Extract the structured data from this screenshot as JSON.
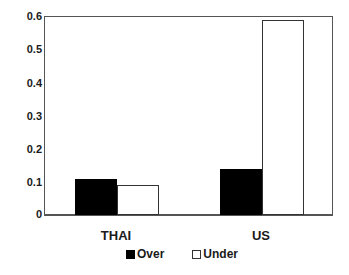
{
  "chart_data": {
    "type": "bar",
    "title": "",
    "xlabel": "",
    "ylabel": "",
    "categories": [
      "THAI",
      "US"
    ],
    "series": [
      {
        "name": "Over",
        "values": [
          0.11,
          0.14
        ],
        "color": "#000000"
      },
      {
        "name": "Under",
        "values": [
          0.09,
          0.59
        ],
        "color": "#ffffff"
      }
    ],
    "ylim": [
      0,
      0.6
    ],
    "yticks": [
      "0",
      "0.1",
      "0.2",
      "0.3",
      "0.4",
      "0.5",
      "0.6"
    ],
    "grid": false,
    "legend_position": "bottom"
  },
  "axis": {
    "yticks": [
      "0.6",
      "0.5",
      "0.4",
      "0.3",
      "0.2",
      "0.1",
      "0"
    ],
    "xcategories": [
      "THAI",
      "US"
    ]
  },
  "legend": {
    "over": "Over",
    "under": "Under"
  }
}
